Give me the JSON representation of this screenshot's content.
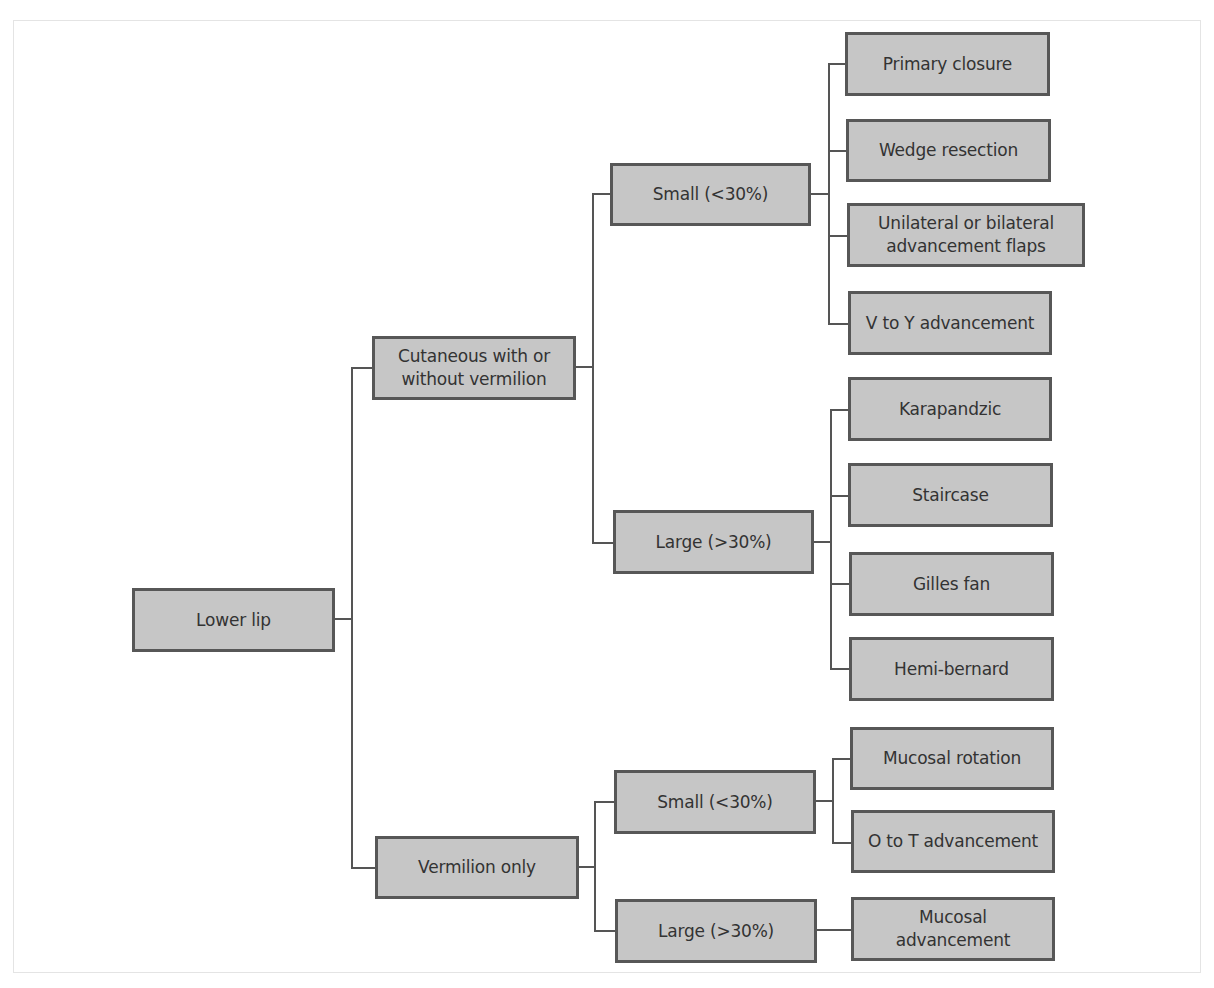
{
  "diagram": {
    "type": "tree",
    "root": "Lower lip",
    "nodes": {
      "root": {
        "label": "Lower lip"
      },
      "cutaneous": {
        "label": "Cutaneous with or without vermilion"
      },
      "vermilion": {
        "label": "Vermilion only"
      },
      "cut_small": {
        "label": "Small (<30%)"
      },
      "cut_large": {
        "label": "Large (>30%)"
      },
      "ver_small": {
        "label": "Small (<30%)"
      },
      "ver_large": {
        "label": "Large (>30%)"
      },
      "primary_closure": {
        "label": "Primary closure"
      },
      "wedge_resection": {
        "label": "Wedge resection"
      },
      "advancement_flaps": {
        "label": "Unilateral or bilateral advancement flaps"
      },
      "v_to_y": {
        "label": "V to Y advancement"
      },
      "karapandzic": {
        "label": "Karapandzic"
      },
      "staircase": {
        "label": "Staircase"
      },
      "gilles_fan": {
        "label": "Gilles fan"
      },
      "hemi_bernard": {
        "label": "Hemi-bernard"
      },
      "mucosal_rotation": {
        "label": "Mucosal rotation"
      },
      "o_to_t": {
        "label": "O to T advancement"
      },
      "mucosal_advancement": {
        "label": "Mucosal advancement"
      }
    },
    "edges": [
      [
        "root",
        "cutaneous"
      ],
      [
        "root",
        "vermilion"
      ],
      [
        "cutaneous",
        "cut_small"
      ],
      [
        "cutaneous",
        "cut_large"
      ],
      [
        "cut_small",
        "primary_closure"
      ],
      [
        "cut_small",
        "wedge_resection"
      ],
      [
        "cut_small",
        "advancement_flaps"
      ],
      [
        "cut_small",
        "v_to_y"
      ],
      [
        "cut_large",
        "karapandzic"
      ],
      [
        "cut_large",
        "staircase"
      ],
      [
        "cut_large",
        "gilles_fan"
      ],
      [
        "cut_large",
        "hemi_bernard"
      ],
      [
        "vermilion",
        "ver_small"
      ],
      [
        "vermilion",
        "ver_large"
      ],
      [
        "ver_small",
        "mucosal_rotation"
      ],
      [
        "ver_small",
        "o_to_t"
      ],
      [
        "ver_large",
        "mucosal_advancement"
      ]
    ],
    "colors": {
      "node_fill": "#c6c6c6",
      "node_border": "#575757",
      "text": "#333333",
      "connector": "#555555"
    }
  }
}
